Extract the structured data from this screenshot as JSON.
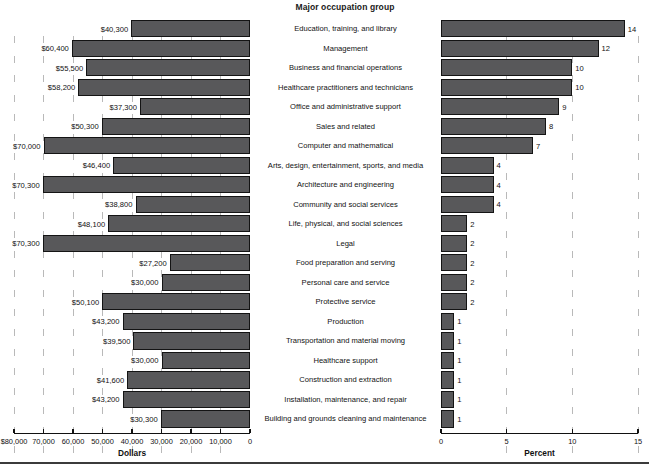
{
  "center": {
    "title": "Major occupation group"
  },
  "left_axis": {
    "title": "Dollars",
    "ticks": [
      "$80,000",
      "70,000",
      "60,000",
      "50,000",
      "40,000",
      "30,000",
      "20,000",
      "10,000",
      "0"
    ],
    "tick_values": [
      80000,
      70000,
      60000,
      50000,
      40000,
      30000,
      20000,
      10000,
      0
    ],
    "min": 0,
    "max": 80000
  },
  "right_axis": {
    "title": "Percent",
    "ticks": [
      "0",
      "5",
      "10",
      "15"
    ],
    "tick_values": [
      0,
      5,
      10,
      15
    ],
    "min": 0,
    "max": 15
  },
  "colors": {
    "bar_fill": "#58585a",
    "bar_edge": "#141414",
    "gridline": "#b9b9b9",
    "axis": "#111111",
    "background": "#ffffff"
  },
  "chart_data": {
    "type": "bar",
    "title": "Major occupation group",
    "orientation": "horizontal",
    "layout": "back-to-back dual panel, left panel reversed axis",
    "grid": "vertical dashed gridlines on both panels",
    "legend": "none",
    "categories": [
      "Education, training, and library",
      "Management",
      "Business and financial operations",
      "Healthcare practitioners and technicians",
      "Office and administrative support",
      "Sales and related",
      "Computer and mathematical",
      "Arts, design, entertainment, sports, and media",
      "Architecture and engineering",
      "Community and social services",
      "Life, physical, and social sciences",
      "Legal",
      "Food preparation and serving",
      "Personal care and service",
      "Protective service",
      "Production",
      "Transportation and material moving",
      "Healthcare support",
      "Construction and extraction",
      "Installation, maintenance, and repair",
      "Building and grounds cleaning and maintenance"
    ],
    "series": [
      {
        "name": "Dollars",
        "panel": "left",
        "xlabel": "Dollars",
        "xlim": [
          0,
          80000
        ],
        "values": [
          40300,
          60400,
          55500,
          58200,
          37300,
          50300,
          70000,
          46400,
          70300,
          38800,
          48100,
          70300,
          27200,
          30000,
          50100,
          43200,
          39500,
          30000,
          41600,
          43200,
          30300
        ],
        "labels": [
          "$40,300",
          "$60,400",
          "$55,500",
          "$58,200",
          "$37,300",
          "$50,300",
          "$70,000",
          "$46,400",
          "$70,300",
          "$38,800",
          "$48,100",
          "$70,300",
          "$27,200",
          "$30,000",
          "$50,100",
          "$43,200",
          "$39,500",
          "$30,000",
          "$41,600",
          "$43,200",
          "$30,300"
        ]
      },
      {
        "name": "Percent",
        "panel": "right",
        "xlabel": "Percent",
        "xlim": [
          0,
          15
        ],
        "values": [
          14,
          12,
          10,
          10,
          9,
          8,
          7,
          4,
          4,
          4,
          2,
          2,
          2,
          2,
          2,
          1,
          1,
          1,
          1,
          1,
          1
        ],
        "labels": [
          "14",
          "12",
          "10",
          "10",
          "9",
          "8",
          "7",
          "4",
          "4",
          "4",
          "2",
          "2",
          "2",
          "2",
          "2",
          "1",
          "1",
          "1",
          "1",
          "1",
          "1"
        ]
      }
    ]
  }
}
